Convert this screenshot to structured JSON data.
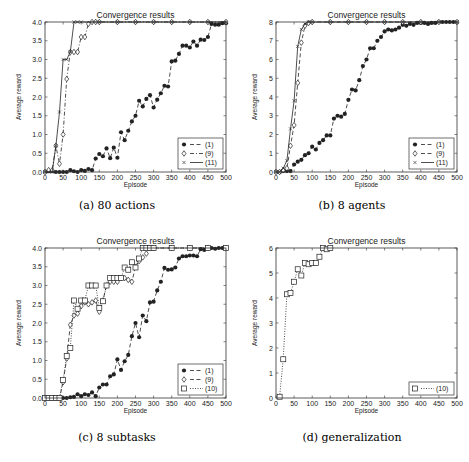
{
  "figure": {
    "captions": [
      "(a) 80 actions",
      "(b) 8 agents",
      "(c) 8 subtasks",
      "(d) generalization"
    ]
  },
  "chart_data": [
    {
      "id": "a",
      "type": "line",
      "title": "Convergence results",
      "xlabel": "Episode",
      "ylabel": "Average reward",
      "xlim": [
        0,
        500
      ],
      "ylim": [
        0,
        4
      ],
      "xticks": [
        0,
        50,
        100,
        150,
        200,
        250,
        300,
        350,
        400,
        450,
        500
      ],
      "yticks": [
        0.0,
        0.5,
        1.0,
        1.5,
        2.0,
        2.5,
        3.0,
        3.5,
        4.0
      ],
      "ytick_format": 1,
      "legend_position": "lower right",
      "frame": {
        "x": 45,
        "y": 22,
        "w": 181,
        "h": 150
      },
      "series": [
        {
          "name": "(1)",
          "marker": "filled-circle",
          "line": "dashed",
          "x": [
            0,
            10,
            20,
            30,
            40,
            50,
            60,
            70,
            80,
            90,
            100,
            110,
            120,
            130,
            140,
            150,
            160,
            170,
            180,
            190,
            200,
            210,
            220,
            230,
            240,
            250,
            260,
            270,
            280,
            290,
            300,
            310,
            320,
            330,
            340,
            350,
            360,
            370,
            380,
            390,
            400,
            410,
            420,
            430,
            440,
            450,
            460,
            470,
            480,
            490,
            500
          ],
          "y": [
            0,
            0.02,
            0.02,
            0,
            0,
            0,
            0,
            0.05,
            0.02,
            0,
            0.05,
            0.03,
            0.08,
            0.05,
            0.36,
            0.48,
            0.42,
            0.63,
            0.37,
            0.65,
            0.38,
            1.06,
            0.85,
            1.1,
            1.35,
            1.5,
            1.9,
            1.75,
            1.95,
            2.05,
            1.72,
            1.93,
            2.1,
            2.3,
            2.28,
            2.95,
            2.97,
            3.15,
            3.37,
            3.37,
            3.32,
            3.48,
            3.37,
            3.53,
            3.52,
            3.6,
            3.95,
            3.93,
            3.93,
            3.97,
            3.97
          ]
        },
        {
          "name": "(9)",
          "marker": "open-diamond",
          "line": "dash-dot",
          "x": [
            0,
            10,
            20,
            30,
            40,
            50,
            60,
            70,
            80,
            90,
            100,
            110,
            120,
            130,
            140,
            150,
            200,
            250,
            300,
            350,
            400,
            450,
            500
          ],
          "y": [
            0,
            0.05,
            0.05,
            0.7,
            0.22,
            1.0,
            2.48,
            3.2,
            3.2,
            3.2,
            3.6,
            3.6,
            3.95,
            4.0,
            4.0,
            4.0,
            4.0,
            4.0,
            4.0,
            4.0,
            4.0,
            4.0,
            4.0
          ]
        },
        {
          "name": "(11)",
          "marker": "cross",
          "line": "solid",
          "x": [
            0,
            10,
            20,
            30,
            40,
            50,
            60,
            70,
            80,
            90,
            100,
            150,
            200,
            250,
            300,
            350,
            400,
            450,
            500
          ],
          "y": [
            0,
            0,
            0,
            0.7,
            1.6,
            3.0,
            3.0,
            3.2,
            4.0,
            4.0,
            4.0,
            4.0,
            4.0,
            4.0,
            4.0,
            4.0,
            4.0,
            4.0,
            4.0
          ]
        }
      ]
    },
    {
      "id": "b",
      "type": "line",
      "title": "Convergence results",
      "xlabel": "Episode",
      "ylabel": "Average reward",
      "xlim": [
        0,
        500
      ],
      "ylim": [
        0,
        8
      ],
      "xticks": [
        0,
        50,
        100,
        150,
        200,
        250,
        300,
        350,
        400,
        450,
        500
      ],
      "yticks": [
        0,
        1,
        2,
        3,
        4,
        5,
        6,
        7,
        8
      ],
      "ytick_format": 0,
      "legend_position": "lower right",
      "frame": {
        "x": 276,
        "y": 22,
        "w": 181,
        "h": 150
      },
      "series": [
        {
          "name": "(1)",
          "marker": "filled-circle",
          "line": "dashed",
          "x": [
            0,
            10,
            20,
            30,
            40,
            50,
            60,
            70,
            80,
            90,
            100,
            110,
            120,
            130,
            140,
            150,
            160,
            170,
            180,
            190,
            200,
            210,
            220,
            230,
            240,
            250,
            260,
            270,
            280,
            290,
            300,
            310,
            320,
            330,
            340,
            350,
            360,
            370,
            380,
            390,
            400,
            410,
            420,
            430,
            440,
            450,
            460,
            470,
            480,
            490,
            500
          ],
          "y": [
            0,
            0,
            0.05,
            0.05,
            0.05,
            0.4,
            0.55,
            0.65,
            0.9,
            1.0,
            1.35,
            1.2,
            1.55,
            1.7,
            1.95,
            1.95,
            2.85,
            3.0,
            2.95,
            3.1,
            3.85,
            4.4,
            4.35,
            4.9,
            5.65,
            6.0,
            6.6,
            6.6,
            7.0,
            7.2,
            7.5,
            7.6,
            7.55,
            7.6,
            7.7,
            7.85,
            7.8,
            7.9,
            7.85,
            7.95,
            7.95,
            7.95,
            7.9,
            7.95,
            7.95,
            8.0,
            8.0,
            8.0,
            8.0,
            8.0,
            8.0
          ]
        },
        {
          "name": "(9)",
          "marker": "open-diamond",
          "line": "dashed",
          "x": [
            0,
            10,
            20,
            30,
            40,
            50,
            60,
            70,
            80,
            90,
            100,
            150,
            200,
            250,
            300,
            350,
            400,
            450,
            500
          ],
          "y": [
            0,
            0,
            0.1,
            0.2,
            1.4,
            2.5,
            4.75,
            6.9,
            7.8,
            7.95,
            8.0,
            8.0,
            8.0,
            8.0,
            8.0,
            8.0,
            8.0,
            8.0,
            8.0
          ]
        },
        {
          "name": "(11)",
          "marker": "cross",
          "line": "solid",
          "x": [
            0,
            10,
            20,
            30,
            40,
            50,
            60,
            70,
            80,
            90,
            100,
            150,
            200,
            250,
            300,
            350,
            400,
            450,
            500
          ],
          "y": [
            0,
            0,
            0.2,
            0.6,
            2.3,
            3.8,
            6.7,
            7.6,
            7.9,
            8.0,
            8.0,
            8.0,
            8.0,
            8.0,
            8.0,
            8.0,
            8.0,
            8.0,
            8.0
          ]
        }
      ]
    },
    {
      "id": "c",
      "type": "line",
      "title": "Convergence results",
      "xlabel": "Episode",
      "ylabel": "Average reward",
      "xlim": [
        0,
        500
      ],
      "ylim": [
        0,
        4
      ],
      "xticks": [
        0,
        50,
        100,
        150,
        200,
        250,
        300,
        350,
        400,
        450,
        500
      ],
      "yticks": [
        0.0,
        0.5,
        1.0,
        1.5,
        2.0,
        2.5,
        3.0,
        3.5,
        4.0
      ],
      "ytick_format": 1,
      "legend_position": "lower right",
      "frame": {
        "x": 45,
        "y": 248,
        "w": 181,
        "h": 150
      },
      "series": [
        {
          "name": "(1)",
          "marker": "filled-circle",
          "line": "dashed",
          "x": [
            0,
            10,
            20,
            30,
            40,
            50,
            60,
            70,
            80,
            90,
            100,
            110,
            120,
            130,
            140,
            150,
            160,
            170,
            180,
            190,
            200,
            210,
            220,
            230,
            240,
            250,
            260,
            270,
            280,
            290,
            300,
            310,
            320,
            330,
            340,
            350,
            360,
            370,
            380,
            390,
            400,
            410,
            420,
            430,
            440,
            450,
            460,
            470,
            480,
            490,
            500
          ],
          "y": [
            0,
            0,
            0,
            0,
            0,
            0,
            0,
            0.02,
            0.03,
            0.1,
            0.05,
            0.1,
            0.08,
            0.15,
            0.05,
            0.28,
            0.36,
            0.36,
            0.58,
            0.63,
            1.03,
            0.75,
            0.98,
            1.15,
            1.65,
            2.0,
            1.62,
            2.2,
            2.05,
            2.55,
            2.57,
            2.87,
            3.1,
            3.47,
            3.42,
            3.43,
            3.48,
            3.72,
            3.78,
            3.78,
            3.8,
            3.8,
            3.78,
            3.97,
            3.95,
            4.0,
            4.0,
            3.98,
            4.0,
            4.0,
            4.0
          ]
        },
        {
          "name": "(9)",
          "marker": "open-diamond",
          "line": "dashed",
          "x": [
            0,
            10,
            20,
            30,
            40,
            50,
            60,
            70,
            80,
            90,
            100,
            110,
            120,
            130,
            140,
            150,
            160,
            170,
            180,
            190,
            200,
            210,
            220,
            230,
            240,
            250,
            260,
            270,
            280,
            290,
            300,
            350,
            400,
            450,
            500
          ],
          "y": [
            0,
            0,
            0,
            0,
            0,
            0.42,
            1.05,
            1.95,
            2.2,
            2.25,
            2.45,
            2.55,
            2.5,
            2.55,
            2.6,
            2.3,
            2.6,
            3.0,
            3.1,
            3.1,
            3.1,
            3.2,
            3.2,
            3.15,
            3.1,
            3.5,
            3.65,
            3.75,
            3.85,
            4.0,
            4.0,
            4.0,
            4.0,
            4.0,
            4.0
          ]
        },
        {
          "name": "(10)",
          "marker": "open-square",
          "line": "dotted",
          "x": [
            0,
            10,
            20,
            30,
            40,
            50,
            60,
            70,
            80,
            90,
            100,
            110,
            120,
            130,
            140,
            150,
            160,
            170,
            180,
            190,
            200,
            210,
            220,
            230,
            240,
            250,
            260,
            270,
            280,
            290,
            300,
            350,
            400,
            450,
            500
          ],
          "y": [
            0,
            0,
            0,
            0,
            0,
            0.48,
            1.12,
            1.33,
            2.6,
            2.38,
            2.6,
            2.6,
            3.0,
            3.0,
            3.0,
            2.4,
            2.58,
            3.0,
            3.2,
            3.2,
            3.2,
            3.2,
            3.48,
            3.42,
            3.62,
            3.48,
            3.72,
            4.0,
            4.0,
            4.0,
            4.0,
            4.0,
            4.0,
            4.0,
            4.0
          ]
        }
      ]
    },
    {
      "id": "d",
      "type": "line",
      "title": "Convergence results",
      "xlabel": "Episode",
      "ylabel": "Average reward",
      "xlim": [
        0,
        500
      ],
      "ylim": [
        0,
        6
      ],
      "xticks": [
        0,
        50,
        100,
        150,
        200,
        250,
        300,
        350,
        400,
        450,
        500
      ],
      "yticks": [
        0,
        1,
        2,
        3,
        4,
        5,
        6
      ],
      "ytick_format": 0,
      "legend_position": "lower right",
      "frame": {
        "x": 276,
        "y": 248,
        "w": 181,
        "h": 150
      },
      "series": [
        {
          "name": "(10)",
          "marker": "open-square",
          "line": "dotted",
          "x": [
            10,
            20,
            30,
            40,
            50,
            60,
            70,
            80,
            90,
            100,
            110,
            120,
            130,
            140,
            150
          ],
          "y": [
            0.05,
            1.55,
            4.15,
            4.2,
            4.65,
            5.15,
            4.9,
            5.4,
            5.35,
            5.4,
            5.4,
            5.65,
            6.0,
            5.95,
            6.0
          ]
        }
      ]
    }
  ]
}
